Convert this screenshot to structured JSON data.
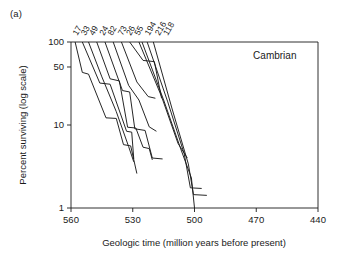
{
  "panel": {
    "label": "(a)"
  },
  "chart_data": {
    "type": "line",
    "title": "",
    "subtitle": "",
    "xlabel": "Geologic time (million years before present)",
    "ylabel": "Percent surviving (log scale)",
    "xlim": [
      560,
      440
    ],
    "ylim": [
      1,
      100
    ],
    "y_scale": "log",
    "x_ticks": [
      560,
      530,
      500,
      470,
      440
    ],
    "x_tick_labels": [
      "560",
      "530",
      "500",
      "470",
      "440"
    ],
    "y_ticks": [
      100,
      50,
      10,
      1
    ],
    "y_tick_labels": [
      "100",
      "50",
      "10",
      "1"
    ],
    "grid": false,
    "legend": "none",
    "annotations": [
      {
        "name": "cambrian-label",
        "text": "Cambrian",
        "x": 461,
        "y": 62
      }
    ],
    "series_label_note": "Rotated cohort labels above the top axis, each naming the survivorship curve starting at that point",
    "series": [
      {
        "name": "17",
        "label": "17",
        "label_x": 557,
        "points": [
          [
            558.0,
            100
          ],
          [
            554.5,
            43
          ],
          [
            551.5,
            41
          ],
          [
            543.0,
            12.2
          ],
          [
            538.0,
            12.0
          ],
          [
            534.5,
            5.8
          ],
          [
            531.0,
            5.6
          ],
          [
            528.0,
            2.6
          ]
        ]
      },
      {
        "name": "33",
        "label": "33",
        "label_x": 553,
        "points": [
          [
            554.5,
            100
          ],
          [
            546.0,
            32
          ],
          [
            541.0,
            31
          ],
          [
            533.0,
            8.4
          ],
          [
            530.5,
            8.2
          ],
          [
            529.5,
            3.9
          ]
        ]
      },
      {
        "name": "49",
        "label": "49",
        "label_x": 549,
        "points": [
          [
            551.5,
            100
          ],
          [
            545.0,
            38
          ],
          [
            538.0,
            14.5
          ],
          [
            532.0,
            5.5
          ],
          [
            529.5,
            3.6
          ]
        ]
      },
      {
        "name": "24",
        "label": "24",
        "label_x": 544,
        "points": [
          [
            547.5,
            100
          ],
          [
            541.0,
            36
          ],
          [
            536.5,
            34
          ],
          [
            532.5,
            9.4
          ],
          [
            528.5,
            9.2
          ],
          [
            525.0,
            5.4
          ],
          [
            522.0,
            5.2
          ],
          [
            520.5,
            3.8
          ]
        ]
      },
      {
        "name": "82",
        "label": "82",
        "label_x": 540,
        "points": [
          [
            543.5,
            100
          ],
          [
            535.0,
            26
          ],
          [
            531.5,
            25
          ],
          [
            529.0,
            9.0
          ],
          [
            524.0,
            8.6
          ],
          [
            520.5,
            4.0
          ],
          [
            515.5,
            3.9
          ]
        ]
      },
      {
        "name": "73",
        "label": "73",
        "label_x": 535,
        "points": [
          [
            539.5,
            100
          ],
          [
            532.0,
            30
          ],
          [
            527.0,
            20
          ],
          [
            522.0,
            9.5
          ],
          [
            518.5,
            8.4
          ]
        ]
      },
      {
        "name": "26",
        "label": "26",
        "label_x": 531,
        "points": [
          [
            535.5,
            100
          ],
          [
            528.0,
            33
          ],
          [
            522.5,
            22
          ],
          [
            519.0,
            21
          ]
        ]
      },
      {
        "name": "55",
        "label": "55",
        "label_x": 527,
        "points": [
          [
            531.5,
            100
          ],
          [
            525.0,
            60
          ],
          [
            519.5,
            58
          ],
          [
            516.0,
            21
          ]
        ]
      },
      {
        "name": "194",
        "label": "194",
        "label_x": 522,
        "points": [
          [
            527.0,
            100
          ],
          [
            516.0,
            22
          ],
          [
            508.0,
            6.0
          ],
          [
            503.5,
            4.0
          ]
        ]
      },
      {
        "name": "216",
        "label": "216",
        "label_x": 517,
        "points": [
          [
            523.0,
            100
          ],
          [
            513.0,
            19
          ],
          [
            505.0,
            4.5
          ],
          [
            502.0,
            1.75
          ],
          [
            496.5,
            1.72
          ]
        ]
      },
      {
        "name": "118",
        "label": "118",
        "label_x": 513,
        "points": [
          [
            520.0,
            100
          ],
          [
            511.0,
            16
          ],
          [
            503.0,
            3.4
          ],
          [
            500.5,
            1.45
          ],
          [
            494.0,
            1.42
          ]
        ]
      },
      {
        "name": "unlabeled-steep-1",
        "label": "",
        "label_x": null,
        "points": [
          [
            525.5,
            100
          ],
          [
            515.0,
            20
          ],
          [
            506.5,
            5.0
          ],
          [
            501.5,
            2.3
          ],
          [
            500.0,
            1.0
          ]
        ]
      }
    ]
  }
}
